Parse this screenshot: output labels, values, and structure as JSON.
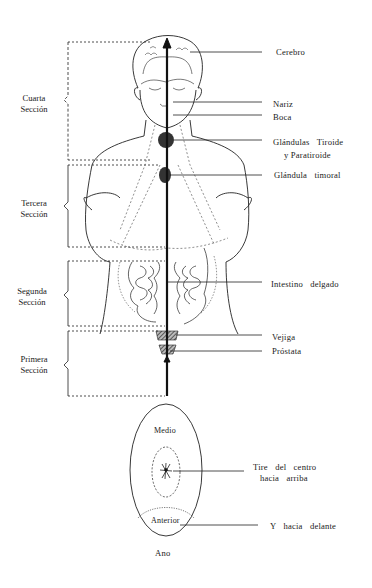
{
  "sections": [
    {
      "id": "cuarta",
      "line1": "Cuarta",
      "line2": "Sección"
    },
    {
      "id": "tercera",
      "line1": "Tercera",
      "line2": "Sección"
    },
    {
      "id": "segunda",
      "line1": "Segunda",
      "line2": "Sección"
    },
    {
      "id": "primera",
      "line1": "Primera",
      "line2": "Sección"
    }
  ],
  "organs": {
    "cerebro": "Cerebro",
    "nariz": "Nariz",
    "boca": "Boca",
    "tiroide_line1": "Glándulas Tiroide",
    "tiroide_line2": "y Paratiroide",
    "timoral": "Glándula timoral",
    "intestino": "Intestino delgado",
    "vejiga": "Vejiga",
    "prostata": "Próstata"
  },
  "perineum": {
    "medio": "Medio",
    "anterior": "Anterior",
    "tire_line1": "Tire del centro",
    "tire_line2": "hacia arriba",
    "delante": "Y hacia delante",
    "ano": "Ano"
  },
  "colors": {
    "ink": "#1a1a1a",
    "background": "#ffffff"
  }
}
